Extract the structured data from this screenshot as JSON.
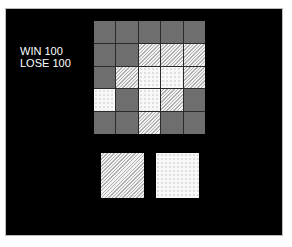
{
  "score": {
    "win_label": "WIN 100",
    "lose_label": "LOSE 100"
  },
  "grid": {
    "rows": 5,
    "cols": 5,
    "cells": [
      [
        "gray",
        "gray",
        "gray",
        "gray",
        "gray"
      ],
      [
        "gray",
        "gray",
        "hatched",
        "hatched",
        "hatched"
      ],
      [
        "gray",
        "hatched",
        "dotted",
        "dotted",
        "hatched"
      ],
      [
        "dotted",
        "gray",
        "dotted",
        "hatched",
        "gray"
      ],
      [
        "gray",
        "gray",
        "hatched",
        "gray",
        "gray"
      ]
    ]
  },
  "choices": [
    {
      "pattern": "hatched"
    },
    {
      "pattern": "dotted"
    }
  ],
  "colors": {
    "background": "#000000",
    "gray_cell": "#6e6e6e",
    "text": "#ffffff"
  }
}
